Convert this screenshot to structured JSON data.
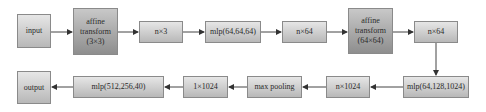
{
  "diagram": {
    "row1": [
      {
        "id": "input",
        "label": "input"
      },
      {
        "id": "affine1",
        "lines": [
          "affine",
          "transform",
          "(3×3)"
        ]
      },
      {
        "id": "n3",
        "label": "n×3"
      },
      {
        "id": "mlp1",
        "label": "mlp(64,64,64)"
      },
      {
        "id": "n64a",
        "label": "n×64"
      },
      {
        "id": "affine2",
        "lines": [
          "affine",
          "transform",
          "(64×64)"
        ]
      },
      {
        "id": "n64b",
        "label": "n×64"
      }
    ],
    "row2": [
      {
        "id": "mlp2",
        "label": "mlp(64,128,1024)"
      },
      {
        "id": "n1024",
        "label": "n×1024"
      },
      {
        "id": "maxpool",
        "label": "max pooling"
      },
      {
        "id": "g1024",
        "label": "1×1024"
      },
      {
        "id": "mlp3",
        "label": "mlp(512,256,40)"
      },
      {
        "id": "output",
        "label": "output"
      }
    ],
    "edges": [
      [
        "input",
        "affine1"
      ],
      [
        "affine1",
        "n3"
      ],
      [
        "n3",
        "mlp1"
      ],
      [
        "mlp1",
        "n64a"
      ],
      [
        "n64a",
        "affine2"
      ],
      [
        "affine2",
        "n64b"
      ],
      [
        "n64b",
        "mlp2"
      ],
      [
        "mlp2",
        "n1024"
      ],
      [
        "n1024",
        "maxpool"
      ],
      [
        "maxpool",
        "g1024"
      ],
      [
        "g1024",
        "mlp3"
      ],
      [
        "mlp3",
        "output"
      ]
    ]
  }
}
